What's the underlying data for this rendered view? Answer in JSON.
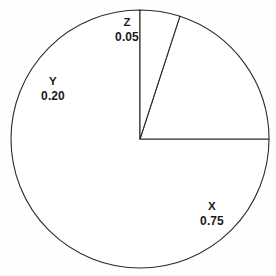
{
  "chart_data": {
    "type": "pie",
    "title": "",
    "subtitle": "",
    "xlabel": "",
    "ylabel": "",
    "categories": [
      "X",
      "Y",
      "Z"
    ],
    "values": [
      0.75,
      0.2,
      0.05
    ],
    "value_labels": [
      "0.75",
      "0.20",
      "0.05"
    ],
    "legend": null,
    "legend_position": "none",
    "grid": false,
    "start_angle_deg": 90,
    "direction": "counterclockwise",
    "slice_fill": "#ffffff",
    "slice_stroke": "#2b2b2b",
    "label_color": "#1a1a1a",
    "background": "#fefefe",
    "center": {
      "x": 140,
      "y": 139
    },
    "radius": 129,
    "slices": [
      {
        "name": "X",
        "value": 0.75,
        "value_label": "0.75",
        "sweep_deg": 270,
        "label_x": 212,
        "label_y": 214
      },
      {
        "name": "Y",
        "value": 0.2,
        "value_label": "0.20",
        "sweep_deg": 72,
        "label_x": 53,
        "label_y": 89
      },
      {
        "name": "Z",
        "value": 0.05,
        "value_label": "0.05",
        "sweep_deg": 18,
        "label_x": 127,
        "label_y": 30
      }
    ]
  }
}
